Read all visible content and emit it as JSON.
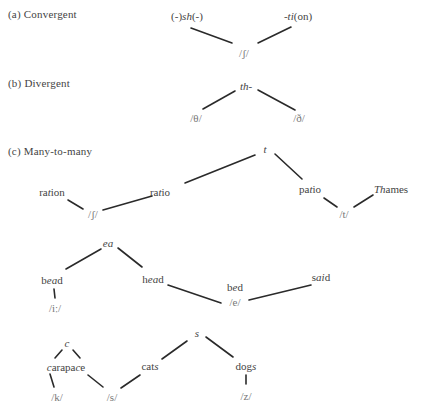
{
  "sections": {
    "a": {
      "label": "(a)  Convergent",
      "nodes": {
        "sh": {
          "pre": "(-)",
          "ital": "sh",
          "post": "(-)"
        },
        "ti": {
          "pre": "-",
          "ital": "ti",
          "post": "(on)"
        },
        "phoneme": "/ʃ/"
      }
    },
    "b": {
      "label": "(b)  Divergent",
      "nodes": {
        "th": "th-",
        "theta": "/θ/",
        "eth": "/ð/"
      }
    },
    "c": {
      "label": "(c)  Many-to-many",
      "group1": {
        "t": "t",
        "ratio": {
          "pre": "ra",
          "ital": "t",
          "post": "io"
        },
        "patio": {
          "pre": "pa",
          "ital": "t",
          "post": "io"
        },
        "ration": {
          "pre": "ra",
          "ital": "t",
          "post": "ion"
        },
        "sh_phoneme": "/ʃ/",
        "thames": {
          "pre": "",
          "ital": "Th",
          "post": "ames"
        },
        "t_phoneme": "/t/"
      },
      "group2": {
        "ea": "ea",
        "bead": {
          "pre": "b",
          "ital": "ea",
          "post": "d"
        },
        "i_phoneme": "/iː/",
        "head": {
          "pre": "h",
          "ital": "ea",
          "post": "d"
        },
        "bed": {
          "pre": "b",
          "ital": "e",
          "post": "d"
        },
        "e_phoneme": "/e/",
        "said": {
          "pre": "s",
          "ital": "ai",
          "post": "d"
        }
      },
      "group3": {
        "s": "s",
        "cats": {
          "pre": "cat",
          "ital": "s",
          "post": ""
        },
        "dogs": {
          "pre": "dog",
          "ital": "s",
          "post": ""
        },
        "z_phoneme": "/z/",
        "c": "c",
        "carapace": {
          "pre": "",
          "ital": "c",
          "mid": "arapa",
          "ital2": "c",
          "post": "e"
        },
        "k_phoneme": "/k/",
        "s_phoneme": "/s/"
      }
    }
  },
  "edges": [
    {
      "from": "sh",
      "to": "sh-phoneme",
      "x1": 191,
      "y1": 28,
      "x2": 232,
      "y2": 43
    },
    {
      "from": "ti",
      "to": "sh-phoneme",
      "x1": 291,
      "y1": 27,
      "x2": 258,
      "y2": 43
    },
    {
      "from": "th",
      "to": "theta",
      "x1": 235,
      "y1": 91,
      "x2": 203,
      "y2": 109
    },
    {
      "from": "th",
      "to": "eth",
      "x1": 258,
      "y1": 90,
      "x2": 295,
      "y2": 110
    },
    {
      "from": "t",
      "to": "ratio",
      "x1": 255,
      "y1": 155,
      "x2": 185,
      "y2": 183
    },
    {
      "from": "t",
      "to": "patio",
      "x1": 275,
      "y1": 154,
      "x2": 302,
      "y2": 179
    },
    {
      "from": "ration",
      "to": "sh2",
      "x1": 68,
      "y1": 200,
      "x2": 83,
      "y2": 209
    },
    {
      "from": "ratio",
      "to": "sh2",
      "x1": 152,
      "y1": 196,
      "x2": 103,
      "y2": 210
    },
    {
      "from": "patio",
      "to": "t-phoneme",
      "x1": 324,
      "y1": 198,
      "x2": 337,
      "y2": 207
    },
    {
      "from": "thames",
      "to": "t-phoneme",
      "x1": 373,
      "y1": 195,
      "x2": 354,
      "y2": 207
    },
    {
      "from": "ea",
      "to": "bead",
      "x1": 101,
      "y1": 249,
      "x2": 66,
      "y2": 269
    },
    {
      "from": "ea",
      "to": "head",
      "x1": 118,
      "y1": 248,
      "x2": 142,
      "y2": 267
    },
    {
      "from": "bead",
      "to": "i-phoneme",
      "x1": 54,
      "y1": 289,
      "x2": 55,
      "y2": 298
    },
    {
      "from": "head",
      "to": "e-phoneme",
      "x1": 168,
      "y1": 285,
      "x2": 221,
      "y2": 303
    },
    {
      "from": "said",
      "to": "e-phoneme",
      "x1": 311,
      "y1": 285,
      "x2": 249,
      "y2": 300
    },
    {
      "from": "s",
      "to": "cats",
      "x1": 187,
      "y1": 341,
      "x2": 162,
      "y2": 359
    },
    {
      "from": "s",
      "to": "dogs",
      "x1": 206,
      "y1": 337,
      "x2": 233,
      "y2": 357
    },
    {
      "from": "dogs",
      "to": "z-phoneme",
      "x1": 246,
      "y1": 375,
      "x2": 246,
      "y2": 384
    },
    {
      "from": "c",
      "to": "carapace-left",
      "x1": 62,
      "y1": 350,
      "x2": 55,
      "y2": 358
    },
    {
      "from": "c",
      "to": "carapace-right",
      "x1": 73,
      "y1": 350,
      "x2": 80,
      "y2": 358
    },
    {
      "from": "carapace",
      "to": "k-phoneme",
      "x1": 50,
      "y1": 374,
      "x2": 54,
      "y2": 387
    },
    {
      "from": "carapace",
      "to": "s-phoneme",
      "x1": 88,
      "y1": 375,
      "x2": 103,
      "y2": 387
    },
    {
      "from": "cats",
      "to": "s-phoneme",
      "x1": 140,
      "y1": 375,
      "x2": 121,
      "y2": 388
    }
  ]
}
